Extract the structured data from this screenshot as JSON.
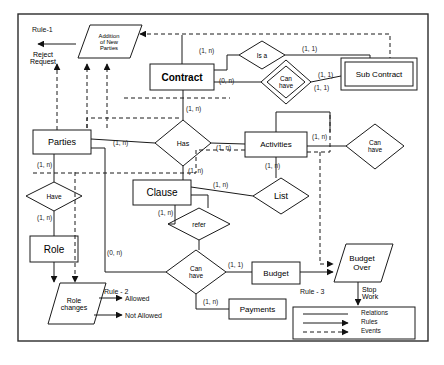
{
  "diagram": {
    "border_color": "#2b2b2b",
    "line_color": "#1a1a1a",
    "fill_color": "#ffffff"
  },
  "entities": [
    {
      "id": "contract",
      "label": "Contract",
      "type": "entity"
    },
    {
      "id": "sub_contract",
      "label": "Sub Contract",
      "type": "weak-entity"
    },
    {
      "id": "parties",
      "label": "Parties",
      "type": "entity"
    },
    {
      "id": "activities",
      "label": "Activities",
      "type": "entity"
    },
    {
      "id": "clause",
      "label": "Clause",
      "type": "entity"
    },
    {
      "id": "role",
      "label": "Role",
      "type": "entity"
    },
    {
      "id": "budget",
      "label": "Budget",
      "type": "entity"
    },
    {
      "id": "payments",
      "label": "Payments",
      "type": "entity"
    }
  ],
  "relationships": [
    {
      "id": "is_a",
      "label": "Is a",
      "type": "diamond"
    },
    {
      "id": "can_have_sub",
      "label": "Can\nhave",
      "type": "double-diamond"
    },
    {
      "id": "has",
      "label": "Has",
      "type": "diamond"
    },
    {
      "id": "can_have_act",
      "label": "Can\nhave",
      "type": "diamond"
    },
    {
      "id": "have_role",
      "label": "Have",
      "type": "diamond"
    },
    {
      "id": "list",
      "label": "List",
      "type": "diamond"
    },
    {
      "id": "refer",
      "label": "refer",
      "type": "diamond"
    },
    {
      "id": "can_have_budget",
      "label": "Can\nhave",
      "type": "diamond"
    }
  ],
  "events": [
    {
      "id": "addition_of_new_parties",
      "label": "Addition\nof  New\nParties",
      "type": "parallelogram"
    },
    {
      "id": "role_changes",
      "label": "Role\nchanges",
      "type": "parallelogram"
    },
    {
      "id": "budget_over",
      "label": "Budget\nOver",
      "type": "parallelogram"
    }
  ],
  "rules": [
    {
      "id": "rule1",
      "name": "Rule-1",
      "outcomes": [
        "Reject\nRequest"
      ]
    },
    {
      "id": "rule2",
      "name": "Rule - 2",
      "outcomes": [
        "Allowed",
        "Not Allowed"
      ]
    },
    {
      "id": "rule3",
      "name": "Rule - 3",
      "outcomes": [
        "Stop\nWork"
      ]
    }
  ],
  "cardinalities": [
    {
      "id": "c1",
      "text": "(1, n)"
    },
    {
      "id": "c2",
      "text": "(1, 1)"
    },
    {
      "id": "c3",
      "text": "(1, 1)"
    },
    {
      "id": "c4",
      "text": "(0, n)"
    },
    {
      "id": "c5",
      "text": "(1, 1)"
    },
    {
      "id": "c6",
      "text": "(1, n)"
    },
    {
      "id": "c7",
      "text": "(1, n)"
    },
    {
      "id": "c8",
      "text": "(1, n)"
    },
    {
      "id": "c9",
      "text": "(1, n)"
    },
    {
      "id": "c10",
      "text": "(1, n)"
    },
    {
      "id": "c11",
      "text": "(1, n)"
    },
    {
      "id": "c12",
      "text": "(1, n)"
    },
    {
      "id": "c13",
      "text": "(1, n)"
    },
    {
      "id": "c14",
      "text": "(1, n)"
    },
    {
      "id": "c15",
      "text": "(0, n)"
    },
    {
      "id": "c16",
      "text": "(1, n)"
    },
    {
      "id": "c17",
      "text": "(1, 1)"
    },
    {
      "id": "c18",
      "text": "(1, n)"
    }
  ],
  "legend": {
    "items": [
      {
        "id": "relations",
        "label": "Relations",
        "style": "solid-line"
      },
      {
        "id": "rules",
        "label": "Rules",
        "style": "solid-arrow"
      },
      {
        "id": "events",
        "label": "Events",
        "style": "dashed-arrow"
      }
    ]
  }
}
